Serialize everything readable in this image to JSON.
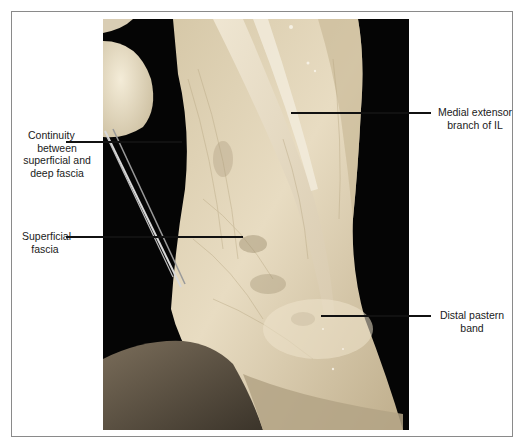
{
  "figure": {
    "type": "anatomical-dissection-photo",
    "labels": {
      "continuity": [
        "Continuity",
        "between",
        "superficial and",
        "deep fascia"
      ],
      "superficial": [
        "Superficial",
        "fascia"
      ],
      "medial": [
        "Medial extensor",
        "branch of IL"
      ],
      "distal": [
        "Distal pastern",
        "band"
      ]
    },
    "caption_visible": "(caption cut off at bottom edge)",
    "colors": {
      "frame_border": "#8a8a8a",
      "photo_background": "#050505",
      "tissue_light": "#e9dcc0",
      "tissue_mid": "#cdbd9c",
      "tissue_dark": "#8d7f66",
      "leader_line": "#111111"
    }
  }
}
